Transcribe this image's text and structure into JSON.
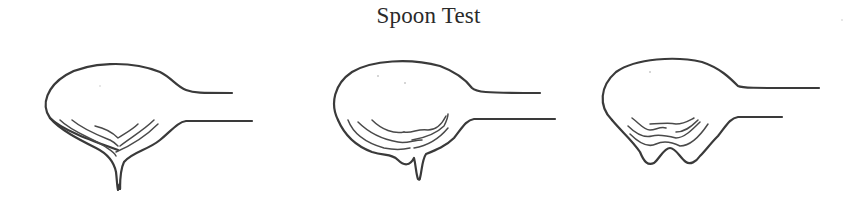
{
  "figure": {
    "title": "Spoon Test",
    "stroke_color": "#3a3a3a",
    "background": "#ffffff"
  },
  "spoons": [
    {
      "name": "spoon-1",
      "description": "single thin drip falling from center of bowl"
    },
    {
      "name": "spoon-2",
      "description": "single short drip slightly right of center"
    },
    {
      "name": "spoon-3",
      "description": "bowl bottom sagging into two rounded lobes, no drip"
    }
  ]
}
